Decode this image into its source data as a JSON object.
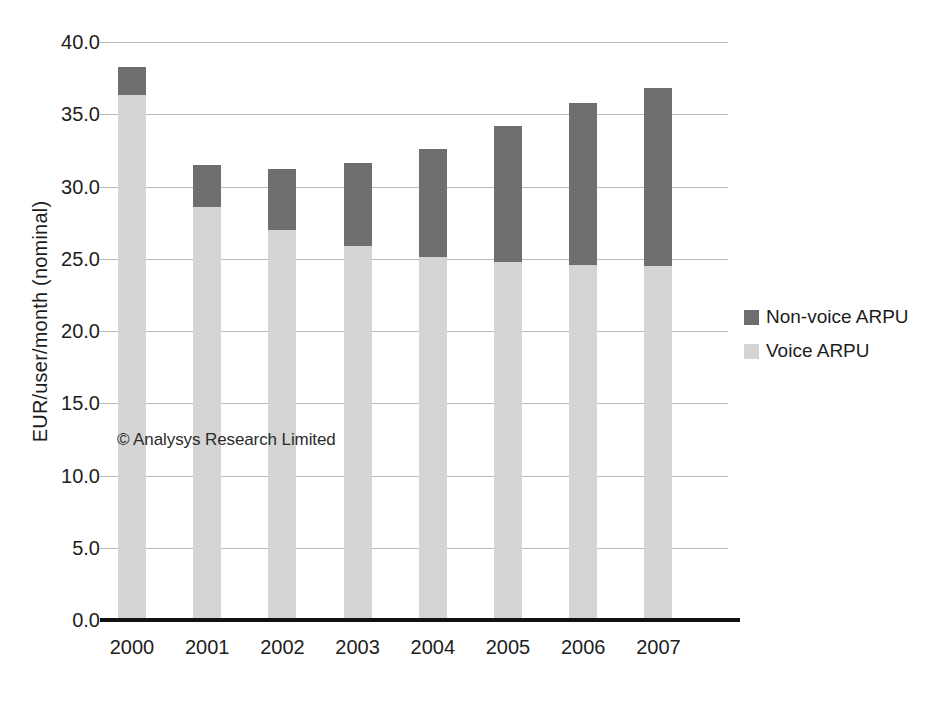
{
  "chart_data": {
    "type": "bar",
    "subtype": "stacked-column",
    "title": "",
    "subtitle": "",
    "xlabel": "",
    "ylabel": "EUR/user/month (nominal)",
    "categories": [
      "2000",
      "2001",
      "2002",
      "2003",
      "2004",
      "2005",
      "2006",
      "2007"
    ],
    "series": [
      {
        "name": "Voice ARPU",
        "color": "#d4d4d4",
        "values": [
          36.3,
          28.6,
          27.0,
          25.9,
          25.1,
          24.8,
          24.6,
          24.5
        ]
      },
      {
        "name": "Non-voice ARPU",
        "color": "#6e6e6e",
        "values": [
          2.0,
          2.9,
          4.2,
          5.7,
          7.5,
          9.4,
          11.2,
          12.3
        ]
      }
    ],
    "stack_order": [
      "Voice ARPU",
      "Non-voice ARPU"
    ],
    "totals": [
      38.3,
      31.5,
      31.2,
      31.6,
      32.6,
      34.2,
      35.8,
      36.8
    ],
    "ylim": [
      0.0,
      40.0
    ],
    "ytick_step": 5.0,
    "ytick_labels": [
      "40.0",
      "35.0",
      "30.0",
      "25.0",
      "20.0",
      "15.0",
      "10.0",
      "5.0",
      "0.0"
    ],
    "ytick_values": [
      40.0,
      35.0,
      30.0,
      25.0,
      20.0,
      15.0,
      10.0,
      5.0,
      0.0
    ],
    "grid": true,
    "grid_color": "#b9b9b9",
    "legend_position": "right",
    "legend": [
      {
        "label": "Non-voice ARPU",
        "color": "#6e6e6e"
      },
      {
        "label": "Voice ARPU",
        "color": "#d4d4d4"
      }
    ],
    "annotations": [
      {
        "text": "© Analysys Research Limited"
      }
    ],
    "background": "#ffffff",
    "axis_color": "#111111"
  },
  "watermark": "© Analysys Research Limited"
}
